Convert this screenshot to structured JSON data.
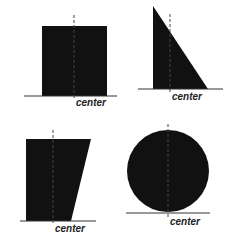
{
  "diagram": {
    "fill_color": "#111111",
    "line_color": "#333333",
    "background": "#ffffff",
    "panels": [
      {
        "id": "square",
        "shape": "rectangle",
        "label": "center",
        "points": [
          [
            42,
            26
          ],
          [
            107,
            26
          ],
          [
            107,
            96
          ],
          [
            42,
            96
          ]
        ],
        "baseline": {
          "x1": 24,
          "x2": 117,
          "y": 96
        },
        "center_line": {
          "x": 74,
          "y1": 15,
          "y2": 100
        },
        "label_pos": {
          "x": 76,
          "y": 106
        }
      },
      {
        "id": "right-triangle",
        "shape": "triangle",
        "label": "center",
        "points": [
          [
            153,
            6
          ],
          [
            153,
            89
          ],
          [
            208,
            89
          ]
        ],
        "baseline": {
          "x1": 138,
          "x2": 223,
          "y": 89
        },
        "center_line": {
          "x": 170,
          "y1": 14,
          "y2": 93
        },
        "label_pos": {
          "x": 172,
          "y": 100
        }
      },
      {
        "id": "trapezoid",
        "shape": "trapezoid",
        "label": "center",
        "points": [
          [
            26,
            139
          ],
          [
            91,
            139
          ],
          [
            71,
            221
          ],
          [
            26,
            221
          ]
        ],
        "baseline": {
          "x1": 20,
          "x2": 96,
          "y": 221
        },
        "center_line": {
          "x": 53,
          "y1": 130,
          "y2": 225
        },
        "label_pos": {
          "x": 55,
          "y": 232
        }
      },
      {
        "id": "circle",
        "shape": "circle",
        "label": "center",
        "circle": {
          "cx": 168,
          "cy": 171,
          "r": 41
        },
        "baseline": {
          "x1": 126,
          "x2": 210,
          "y": 213
        },
        "center_line": {
          "x": 168,
          "y1": 124,
          "y2": 218
        },
        "label_pos": {
          "x": 170,
          "y": 225
        }
      }
    ]
  }
}
